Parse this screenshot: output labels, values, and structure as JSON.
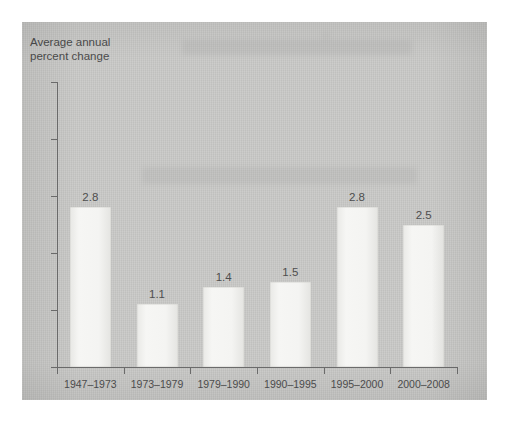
{
  "chart_data": {
    "type": "bar",
    "title": "",
    "subtitle": "",
    "xlabel": "",
    "ylabel": "Average annual\npercent change",
    "categories": [
      "1947–1973",
      "1973–1979",
      "1979–1990",
      "1990–1995",
      "1995–2000",
      "2000–2008"
    ],
    "values": [
      2.8,
      1.1,
      1.4,
      1.5,
      2.8,
      2.5
    ],
    "value_labels": [
      "2.8",
      "1.1",
      "1.4",
      "1.5",
      "2.8",
      "2.5"
    ],
    "ylim": [
      0,
      5
    ],
    "ytick_labels": [
      "0",
      "1",
      "2",
      "3",
      "4",
      "5"
    ],
    "ytick_values": [
      0,
      1,
      2,
      3,
      4,
      5
    ],
    "grid": false,
    "legend": false,
    "legend_position": "none",
    "bar_fill_color": "#f4f4f2",
    "axis_color": "#6c6c6c",
    "text_color": "#4e4e4e",
    "panel_background_color": "#c9c9c7",
    "page_background_color": "#ffffff"
  }
}
